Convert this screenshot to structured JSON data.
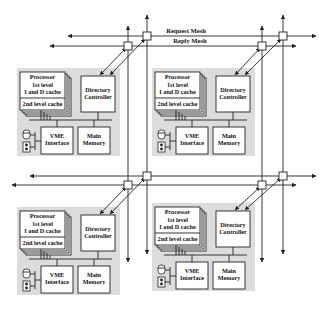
{
  "diagram": {
    "mesh": {
      "request_label": "Request Mesh",
      "reply_label": "Reply Mesh"
    },
    "nodes": [
      {
        "id": "top-left",
        "processor": {
          "title": "Processor",
          "l1_line1": "1st level",
          "l1_line2": "I and D cache",
          "l2": "2nd level cache"
        },
        "directory": {
          "line1": "Directory",
          "line2": "Controller"
        },
        "vme": {
          "line1": "VME",
          "line2": "Interface"
        },
        "memory": {
          "line1": "Main",
          "line2": "Memory"
        }
      },
      {
        "id": "top-right",
        "processor": {
          "title": "Processor",
          "l1_line1": "1st level",
          "l1_line2": "I and D cache",
          "l2": "2nd level cache"
        },
        "directory": {
          "line1": "Directory",
          "line2": "Controller"
        },
        "vme": {
          "line1": "VME",
          "line2": "Interface"
        },
        "memory": {
          "line1": "Main",
          "line2": "Memory"
        }
      },
      {
        "id": "bottom-left",
        "processor": {
          "title": "Processor",
          "l1_line1": "1st level",
          "l1_line2": "I and D cache",
          "l2": "2nd level cache"
        },
        "directory": {
          "line1": "Directory",
          "line2": "Controller"
        },
        "vme": {
          "line1": "VME",
          "line2": "Interface"
        },
        "memory": {
          "line1": "Main",
          "line2": "Memory"
        }
      },
      {
        "id": "bottom-right",
        "processor": {
          "title": "Processor",
          "l1_line1": "1st level",
          "l1_line2": "I and D cache",
          "l2": "2nd level cache"
        },
        "directory": {
          "line1": "Directory",
          "line2": "Controller"
        },
        "vme": {
          "line1": "VME",
          "line2": "Interface"
        },
        "memory": {
          "line1": "Main",
          "line2": "Memory"
        }
      }
    ],
    "colors": {
      "panel": "#dcdcdc",
      "line": "#222222",
      "box": "#ffffff"
    }
  }
}
